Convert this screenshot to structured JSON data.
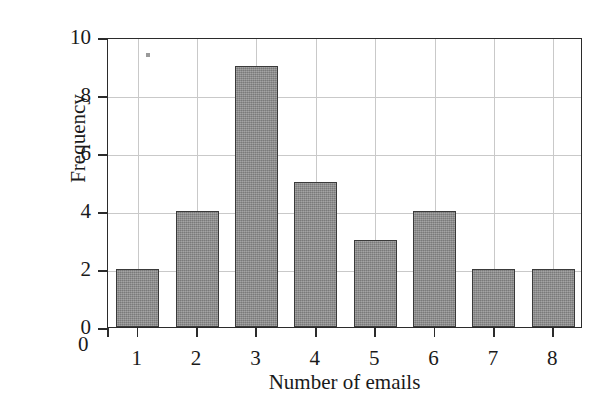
{
  "chart_data": {
    "type": "bar",
    "title": "",
    "xlabel": "Number of emails",
    "ylabel": "Frequency",
    "categories": [
      "1",
      "2",
      "3",
      "4",
      "5",
      "6",
      "7",
      "8"
    ],
    "values": [
      2,
      4,
      9,
      5,
      3,
      4,
      2,
      2
    ],
    "ylim": [
      0,
      10
    ],
    "yticks": [
      "0",
      "2",
      "4",
      "6",
      "8",
      "10"
    ],
    "ytick_values": [
      0,
      2,
      4,
      6,
      8,
      10
    ],
    "xticks": [
      "1",
      "2",
      "3",
      "4",
      "5",
      "6",
      "7",
      "8"
    ],
    "origin_label": "0",
    "grid": true,
    "legend": null,
    "colors": {
      "bar_fill": "#8b8b8b",
      "bar_edge": "#3a3a3a",
      "grid": "#c9c9c9",
      "axis": "#2b2b2b",
      "background": "#ffffff",
      "text": "#1a1a1a"
    }
  }
}
